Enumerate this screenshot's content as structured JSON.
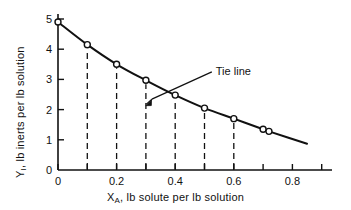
{
  "chart_data": {
    "type": "line",
    "title": "",
    "xlabel": "X_A, lb solute per lb solution",
    "xlabel_main": "X",
    "xlabel_sub": "A",
    "xlabel_rest": ", lb solute per lb solution",
    "ylabel": "Y_I, lb inerts per lb solution",
    "ylabel_main": "Y",
    "ylabel_sub": "I",
    "ylabel_rest": ", lb inerts per lb solution",
    "xlim": [
      0,
      0.95
    ],
    "ylim": [
      0,
      5.45
    ],
    "xticks": [
      0,
      0.2,
      0.4,
      0.6,
      0.8
    ],
    "xticklabels": [
      "0",
      "0.2",
      "0.4",
      "0.6",
      "0.8"
    ],
    "xminorticks": [
      0.1,
      0.3,
      0.5,
      0.7,
      0.9
    ],
    "yticks": [
      0,
      1,
      2,
      3,
      4,
      5
    ],
    "yticklabels": [
      "0",
      "1",
      "2",
      "3",
      "4",
      "5"
    ],
    "grid": false,
    "legend": null,
    "marker": "open-circle",
    "linecolor": "#111111",
    "x": [
      0.0,
      0.1,
      0.2,
      0.3,
      0.4,
      0.5,
      0.6,
      0.7,
      0.72
    ],
    "values": [
      4.9,
      4.15,
      3.5,
      2.97,
      2.48,
      2.05,
      1.7,
      1.35,
      1.28
    ],
    "curve_x_end": 0.85,
    "curve_y_end": 0.87,
    "dropline_x": [
      0.1,
      0.2,
      0.3,
      0.4,
      0.5,
      0.6
    ],
    "annotations": [
      {
        "text": "Tie line",
        "text_x": 0.555,
        "text_y": 3.37,
        "arrow_tip_x": 0.3,
        "arrow_tip_y": 2.18,
        "leader_from_x": 0.525,
        "leader_from_y": 3.25
      }
    ]
  }
}
